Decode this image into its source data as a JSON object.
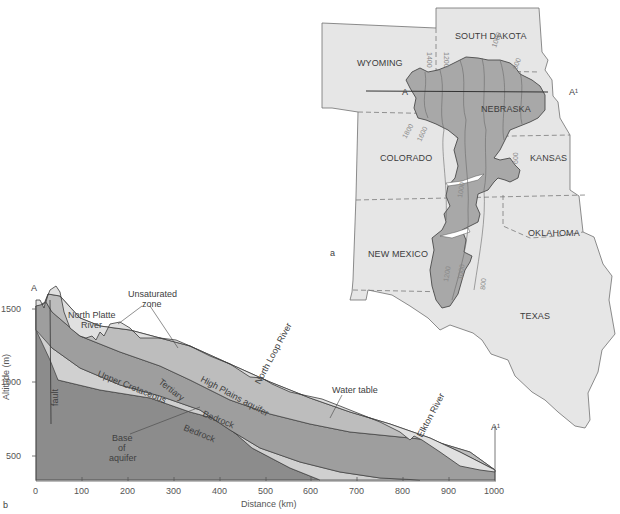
{
  "figure": {
    "panel_a": {
      "label": "a",
      "states": [
        {
          "name": "SOUTH DAKOTA"
        },
        {
          "name": "WYOMING"
        },
        {
          "name": "NEBRASKA"
        },
        {
          "name": "COLORADO"
        },
        {
          "name": "KANSAS"
        },
        {
          "name": "OKLAHOMA"
        },
        {
          "name": "NEW MEXICO"
        },
        {
          "name": "TEXAS"
        }
      ],
      "section_line": {
        "start": "A",
        "end": "A¹"
      },
      "contour_labels": [
        "1400",
        "1200",
        "1000",
        "800",
        "1800",
        "1600",
        "600",
        "1000",
        "1200",
        "1000",
        "800"
      ],
      "colors": {
        "states_fill": "#e6e6e6",
        "aquifer_fill": "#a8a8a8",
        "background": "#ffffff"
      }
    },
    "panel_b": {
      "label": "b",
      "start_label": "A",
      "end_label": "A¹",
      "xlabel": "Distance (km)",
      "ylabel": "Altitude (m)",
      "x_ticks": [
        "0",
        "100",
        "200",
        "300",
        "400",
        "500",
        "600",
        "700",
        "800",
        "900",
        "1000"
      ],
      "y_ticks": [
        "500",
        "1000",
        "1500"
      ],
      "annotations": {
        "unsaturated_zone": "Unsaturated zone",
        "unsaturated_line1": "Unsaturated",
        "unsaturated_line2": "zone",
        "north_platte_line1": "North Platte",
        "north_platte_line2": "River",
        "north_loop": "North Loop River",
        "water_table": "Water table",
        "elkton": "Elkton River",
        "high_plains": "High Plains aquifer",
        "tertiary": "Tertiary",
        "bedrock_upper": "Bedrock",
        "bedrock_lower": "Bedrock",
        "upper_cretaceous": "Upper Cretaceous",
        "fault": "fault",
        "base_line1": "Base",
        "base_line2": "of",
        "base_line3": "aquifer"
      },
      "colors": {
        "unsaturated": "#e0e0e0",
        "high_plains_aquifer": "#bdbdbd",
        "tertiary_bedrock": "#9e9e9e",
        "upper_cretaceous": "#d0d0d0",
        "deep_bedrock": "#8c8c8c"
      }
    }
  }
}
